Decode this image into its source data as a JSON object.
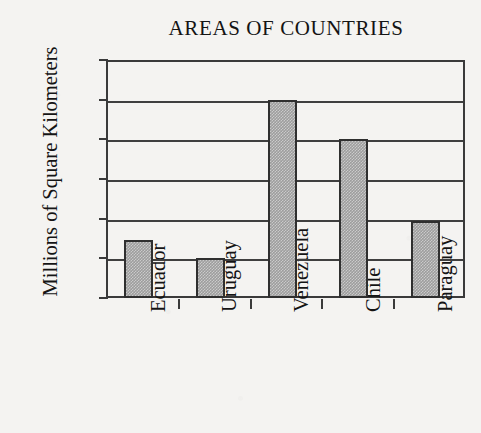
{
  "chart_data": {
    "type": "bar",
    "title": "AREAS OF COUNTRIES",
    "xlabel": "",
    "ylabel": "Millions of Square Kilometers",
    "categories": [
      "Ecuador",
      "Uruguay",
      "Venezuela",
      "Chile",
      "Paraguay"
    ],
    "values": [
      0.29,
      0.2,
      1.0,
      0.8,
      0.39
    ],
    "ylim": [
      0,
      1.2
    ],
    "ytick_labels": [
      "1.2",
      "1.0",
      "0.8",
      "0.6",
      "0.4",
      "0.2",
      "0"
    ],
    "ytick_values": [
      1.2,
      1.0,
      0.8,
      0.6,
      0.4,
      0.2,
      0
    ],
    "grid": true,
    "legend": "none",
    "bar_fill_color": "#9d9d9d",
    "bar_edge_color": "#2f2f2f",
    "axis_color": "#3a3a3a",
    "background_color": "#f4f3f1",
    "text_color": "#141414"
  }
}
